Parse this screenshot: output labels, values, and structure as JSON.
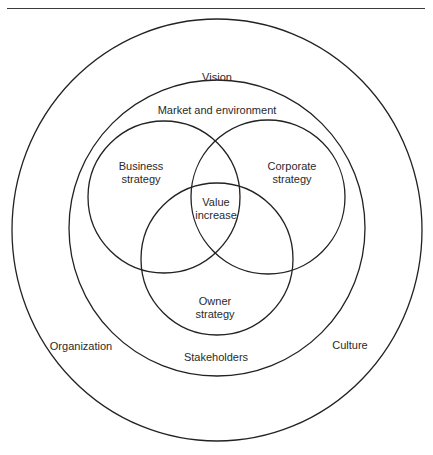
{
  "diagram": {
    "type": "nested-venn",
    "rings": [
      {
        "id": "outer",
        "labels": [
          "Vision",
          "Organization",
          "Culture"
        ]
      },
      {
        "id": "middle",
        "labels": [
          "Market and environment",
          "Stakeholders"
        ]
      }
    ],
    "circles": [
      {
        "id": "business",
        "label_line1": "Business",
        "label_line2": "strategy"
      },
      {
        "id": "corporate",
        "label_line1": "Corporate",
        "label_line2": "strategy"
      },
      {
        "id": "owner",
        "label_line1": "Owner",
        "label_line2": "strategy"
      }
    ],
    "center": {
      "label_line1": "Value",
      "label_line2": "increase"
    },
    "line_color": "#222222"
  },
  "labels": {
    "vision": "Vision",
    "market": "Market and environment",
    "organization": "Organization",
    "stakeholders": "Stakeholders",
    "culture": "Culture",
    "business1": "Business",
    "business2": "strategy",
    "corporate1": "Corporate",
    "corporate2": "strategy",
    "value1": "Value",
    "value2": "increase",
    "owner1": "Owner",
    "owner2": "strategy"
  }
}
